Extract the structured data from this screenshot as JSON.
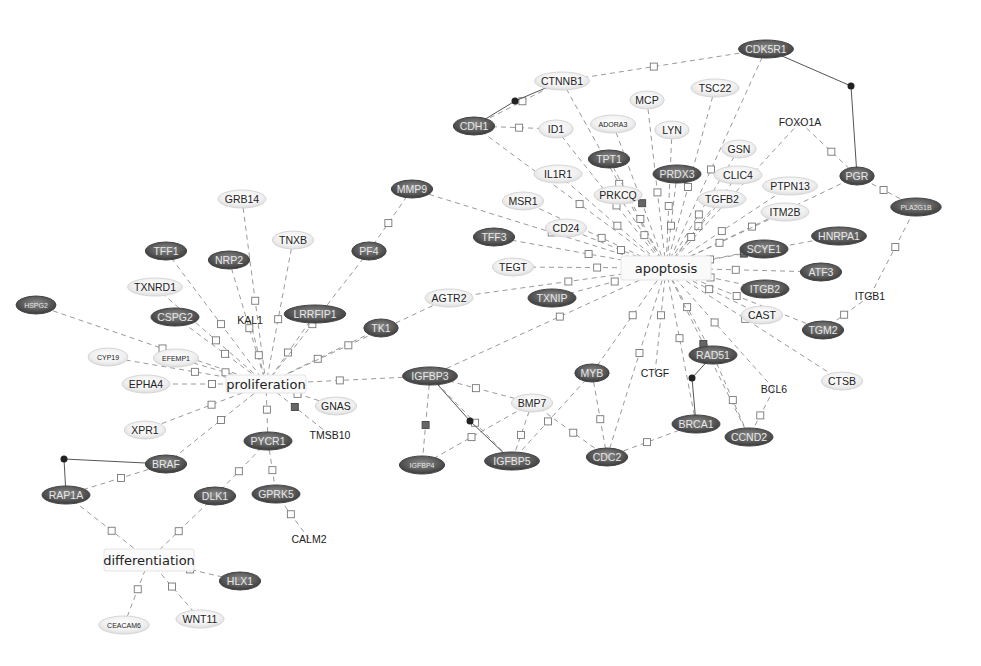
{
  "diagram": {
    "type": "gene-interaction-network",
    "processes": [
      {
        "id": "apoptosis",
        "label": "apoptosis",
        "x": 666,
        "y": 268,
        "w": 90,
        "h": 24
      },
      {
        "id": "proliferation",
        "label": "proliferation",
        "x": 266,
        "y": 384,
        "w": 80,
        "h": 18
      },
      {
        "id": "differentiation",
        "label": "differentiation",
        "x": 149,
        "y": 560,
        "w": 90,
        "h": 22
      }
    ],
    "nodes": [
      {
        "id": "CDK5R1",
        "label": "CDK5R1",
        "x": 766,
        "y": 49,
        "style": "dark"
      },
      {
        "id": "CTNNB1",
        "label": "CTNNB1",
        "x": 562,
        "y": 81,
        "style": "light"
      },
      {
        "id": "TSC22",
        "label": "TSC22",
        "x": 715,
        "y": 88,
        "style": "light"
      },
      {
        "id": "MCP",
        "label": "MCP",
        "x": 647,
        "y": 100,
        "style": "light"
      },
      {
        "id": "CDH1",
        "label": "CDH1",
        "x": 474,
        "y": 126,
        "style": "dark"
      },
      {
        "id": "ID1",
        "label": "ID1",
        "x": 556,
        "y": 129,
        "style": "light"
      },
      {
        "id": "ADORA3",
        "label": "ADORA3",
        "x": 613,
        "y": 124,
        "style": "light",
        "small": true
      },
      {
        "id": "LYN",
        "label": "LYN",
        "x": 672,
        "y": 130,
        "style": "light"
      },
      {
        "id": "FOXO1A",
        "label": "FOXO1A",
        "x": 800,
        "y": 122,
        "style": "plain"
      },
      {
        "id": "GSN",
        "label": "GSN",
        "x": 739,
        "y": 149,
        "style": "light"
      },
      {
        "id": "TPT1",
        "label": "TPT1",
        "x": 609,
        "y": 159,
        "style": "dark"
      },
      {
        "id": "PRDX3",
        "label": "PRDX3",
        "x": 677,
        "y": 174,
        "style": "dark"
      },
      {
        "id": "CLIC4",
        "label": "CLIC4",
        "x": 738,
        "y": 175,
        "style": "light"
      },
      {
        "id": "IL1R1",
        "label": "IL1R1",
        "x": 558,
        "y": 174,
        "style": "light"
      },
      {
        "id": "PRKCQ",
        "label": "PRKCQ",
        "x": 618,
        "y": 195,
        "style": "light"
      },
      {
        "id": "PGR",
        "label": "PGR",
        "x": 857,
        "y": 176,
        "style": "dark"
      },
      {
        "id": "PTPN13",
        "label": "PTPN13",
        "x": 790,
        "y": 186,
        "style": "light"
      },
      {
        "id": "MMP9",
        "label": "MMP9",
        "x": 412,
        "y": 189,
        "style": "dark"
      },
      {
        "id": "TGFB2",
        "label": "TGFB2",
        "x": 722,
        "y": 199,
        "style": "light"
      },
      {
        "id": "MSR1",
        "label": "MSR1",
        "x": 523,
        "y": 201,
        "style": "light"
      },
      {
        "id": "PLA2G1B",
        "label": "PLA2G1B",
        "x": 916,
        "y": 207,
        "style": "dark",
        "small": true
      },
      {
        "id": "ITM2B",
        "label": "ITM2B",
        "x": 785,
        "y": 212,
        "style": "light"
      },
      {
        "id": "CD24",
        "label": "CD24",
        "x": 566,
        "y": 228,
        "style": "light"
      },
      {
        "id": "TFF3",
        "label": "TFF3",
        "x": 494,
        "y": 237,
        "style": "dark"
      },
      {
        "id": "HNRPA1",
        "label": "HNRPA1",
        "x": 839,
        "y": 236,
        "style": "dark"
      },
      {
        "id": "PF4",
        "label": "PF4",
        "x": 369,
        "y": 251,
        "style": "dark"
      },
      {
        "id": "SCYE1",
        "label": "SCYE1",
        "x": 764,
        "y": 249,
        "style": "dark"
      },
      {
        "id": "TEGT",
        "label": "TEGT",
        "x": 513,
        "y": 267,
        "style": "light"
      },
      {
        "id": "ATF3",
        "label": "ATF3",
        "x": 821,
        "y": 272,
        "style": "dark"
      },
      {
        "id": "AGTR2",
        "label": "AGTR2",
        "x": 449,
        "y": 298,
        "style": "light"
      },
      {
        "id": "TXNIP",
        "label": "TXNIP",
        "x": 552,
        "y": 298,
        "style": "dark"
      },
      {
        "id": "ITOB2",
        "label": "ITGB2",
        "x": 765,
        "y": 289,
        "style": "dark"
      },
      {
        "id": "ITGB1",
        "label": "ITGB1",
        "x": 870,
        "y": 296,
        "style": "plain"
      },
      {
        "id": "CAST",
        "label": "CAST",
        "x": 762,
        "y": 315,
        "style": "light"
      },
      {
        "id": "TGM2",
        "label": "TGM2",
        "x": 823,
        "y": 330,
        "style": "dark"
      },
      {
        "id": "GRB14",
        "label": "GRB14",
        "x": 242,
        "y": 199,
        "style": "light"
      },
      {
        "id": "TNXB",
        "label": "TNXB",
        "x": 293,
        "y": 240,
        "style": "light"
      },
      {
        "id": "TFF1",
        "label": "TFF1",
        "x": 166,
        "y": 251,
        "style": "dark"
      },
      {
        "id": "NRP2",
        "label": "NRP2",
        "x": 229,
        "y": 260,
        "style": "dark"
      },
      {
        "id": "TXNRD1",
        "label": "TXNRD1",
        "x": 155,
        "y": 287,
        "style": "light"
      },
      {
        "id": "HSPG2",
        "label": "HSPG2",
        "x": 36,
        "y": 305,
        "style": "dark",
        "small": true
      },
      {
        "id": "CSPG2",
        "label": "CSPG2",
        "x": 175,
        "y": 317,
        "style": "dark"
      },
      {
        "id": "KAL1",
        "label": "KAL1",
        "x": 250,
        "y": 320,
        "style": "plain"
      },
      {
        "id": "LRRFIP1",
        "label": "LRRFIP1",
        "x": 315,
        "y": 314,
        "style": "dark"
      },
      {
        "id": "TK1",
        "label": "TK1",
        "x": 381,
        "y": 328,
        "style": "dark"
      },
      {
        "id": "CYP19",
        "label": "CYP19",
        "x": 108,
        "y": 357,
        "style": "light",
        "small": true
      },
      {
        "id": "EFEMP1",
        "label": "EFEMP1",
        "x": 176,
        "y": 358,
        "style": "light",
        "small": true
      },
      {
        "id": "EPHA4",
        "label": "EPHA4",
        "x": 146,
        "y": 384,
        "style": "light"
      },
      {
        "id": "GNAS",
        "label": "GNAS",
        "x": 336,
        "y": 406,
        "style": "light"
      },
      {
        "id": "TMSB10",
        "label": "TMSB10",
        "x": 330,
        "y": 435,
        "style": "plain"
      },
      {
        "id": "XPR1",
        "label": "XPR1",
        "x": 145,
        "y": 430,
        "style": "light"
      },
      {
        "id": "PYCR1",
        "label": "PYCR1",
        "x": 268,
        "y": 441,
        "style": "dark"
      },
      {
        "id": "BRAF",
        "label": "BRAF",
        "x": 166,
        "y": 464,
        "style": "dark"
      },
      {
        "id": "RAP1A",
        "label": "RAP1A",
        "x": 66,
        "y": 495,
        "style": "dark"
      },
      {
        "id": "DLK1",
        "label": "DLK1",
        "x": 215,
        "y": 496,
        "style": "dark"
      },
      {
        "id": "GPRK5",
        "label": "GPRK5",
        "x": 276,
        "y": 494,
        "style": "dark"
      },
      {
        "id": "CALM2",
        "label": "CALM2",
        "x": 309,
        "y": 539,
        "style": "plain"
      },
      {
        "id": "HLX1",
        "label": "HLX1",
        "x": 240,
        "y": 581,
        "style": "dark"
      },
      {
        "id": "CEACAM6",
        "label": "CEACAM6",
        "x": 124,
        "y": 625,
        "style": "light",
        "small": true
      },
      {
        "id": "WNT11",
        "label": "WNT11",
        "x": 200,
        "y": 619,
        "style": "light"
      },
      {
        "id": "IGFBP3",
        "label": "IGFBP3",
        "x": 430,
        "y": 376,
        "style": "dark"
      },
      {
        "id": "BMP7",
        "label": "BMP7",
        "x": 532,
        "y": 403,
        "style": "light"
      },
      {
        "id": "MYB",
        "label": "MYB",
        "x": 592,
        "y": 373,
        "style": "dark"
      },
      {
        "id": "CTGF",
        "label": "CTGF",
        "x": 655,
        "y": 373,
        "style": "plain"
      },
      {
        "id": "IGFBP4",
        "label": "IGFBP4",
        "x": 422,
        "y": 465,
        "style": "dark",
        "small": true
      },
      {
        "id": "IGFBP5",
        "label": "IGFBP5",
        "x": 512,
        "y": 461,
        "style": "dark"
      },
      {
        "id": "CDC2",
        "label": "CDC2",
        "x": 607,
        "y": 457,
        "style": "dark"
      },
      {
        "id": "RAD51",
        "label": "RAD51",
        "x": 713,
        "y": 355,
        "style": "dark"
      },
      {
        "id": "BCL6",
        "label": "BCL6",
        "x": 774,
        "y": 389,
        "style": "plain"
      },
      {
        "id": "CTSB",
        "label": "CTSB",
        "x": 842,
        "y": 381,
        "style": "light"
      },
      {
        "id": "BRCA1",
        "label": "BRCA1",
        "x": 696,
        "y": 424,
        "style": "dark"
      },
      {
        "id": "CCND2",
        "label": "CCND2",
        "x": 749,
        "y": 437,
        "style": "dark"
      }
    ],
    "edges": [
      [
        "CTNNB1",
        "apoptosis"
      ],
      [
        "TSC22",
        "apoptosis"
      ],
      [
        "MCP",
        "apoptosis"
      ],
      [
        "CDH1",
        "apoptosis"
      ],
      [
        "ID1",
        "apoptosis"
      ],
      [
        "ADORA3",
        "apoptosis"
      ],
      [
        "LYN",
        "apoptosis"
      ],
      [
        "FOXO1A",
        "apoptosis"
      ],
      [
        "GSN",
        "apoptosis"
      ],
      [
        "TPT1",
        "apoptosis"
      ],
      [
        "PRDX3",
        "apoptosis"
      ],
      [
        "CLIC4",
        "apoptosis"
      ],
      [
        "IL1R1",
        "apoptosis"
      ],
      [
        "PRKCQ",
        "apoptosis"
      ],
      [
        "PGR",
        "apoptosis"
      ],
      [
        "PTPN13",
        "apoptosis"
      ],
      [
        "MMP9",
        "apoptosis"
      ],
      [
        "TGFB2",
        "apoptosis"
      ],
      [
        "MSR1",
        "apoptosis"
      ],
      [
        "ITM2B",
        "apoptosis"
      ],
      [
        "CD24",
        "apoptosis"
      ],
      [
        "TFF3",
        "apoptosis"
      ],
      [
        "HNRPA1",
        "apoptosis"
      ],
      [
        "SCYE1",
        "apoptosis"
      ],
      [
        "TEGT",
        "apoptosis"
      ],
      [
        "ATF3",
        "apoptosis"
      ],
      [
        "AGTR2",
        "apoptosis"
      ],
      [
        "TXNIP",
        "apoptosis"
      ],
      [
        "ITOB2",
        "apoptosis"
      ],
      [
        "CAST",
        "apoptosis"
      ],
      [
        "TGM2",
        "apoptosis"
      ],
      [
        "CTSB",
        "apoptosis"
      ],
      [
        "IGFBP3",
        "apoptosis"
      ],
      [
        "MYB",
        "apoptosis"
      ],
      [
        "CTGF",
        "apoptosis"
      ],
      [
        "CDC2",
        "apoptosis"
      ],
      [
        "RAD51",
        "apoptosis"
      ],
      [
        "BCL6",
        "apoptosis"
      ],
      [
        "BRCA1",
        "apoptosis"
      ],
      [
        "CCND2",
        "apoptosis"
      ],
      [
        "CDK5R1",
        "apoptosis"
      ],
      [
        "CDK5R1",
        "CTNNB1"
      ],
      [
        "GRB14",
        "proliferation"
      ],
      [
        "TNXB",
        "proliferation"
      ],
      [
        "TFF1",
        "proliferation"
      ],
      [
        "NRP2",
        "proliferation"
      ],
      [
        "TXNRD1",
        "proliferation"
      ],
      [
        "HSPG2",
        "proliferation"
      ],
      [
        "CSPG2",
        "proliferation"
      ],
      [
        "KAL1",
        "proliferation"
      ],
      [
        "LRRFIP1",
        "proliferation"
      ],
      [
        "TK1",
        "proliferation"
      ],
      [
        "CYP19",
        "proliferation"
      ],
      [
        "EFEMP1",
        "proliferation"
      ],
      [
        "EPHA4",
        "proliferation"
      ],
      [
        "GNAS",
        "proliferation"
      ],
      [
        "TMSB10",
        "proliferation"
      ],
      [
        "XPR1",
        "proliferation"
      ],
      [
        "PYCR1",
        "proliferation"
      ],
      [
        "BRAF",
        "proliferation"
      ],
      [
        "PF4",
        "proliferation"
      ],
      [
        "IGFBP3",
        "proliferation"
      ],
      [
        "AGTR2",
        "proliferation"
      ],
      [
        "MMP9",
        "PF4"
      ],
      [
        "RAP1A",
        "differentiation"
      ],
      [
        "DLK1",
        "differentiation"
      ],
      [
        "HLX1",
        "differentiation"
      ],
      [
        "CEACAM6",
        "differentiation"
      ],
      [
        "WNT11",
        "differentiation"
      ],
      [
        "PYCR1",
        "DLK1"
      ],
      [
        "PYCR1",
        "GPRK5"
      ],
      [
        "CALM2",
        "GPRK5"
      ],
      [
        "RAP1A",
        "BRAF"
      ],
      [
        "IGFBP3",
        "IGFBP4"
      ],
      [
        "IGFBP3",
        "IGFBP5"
      ],
      [
        "BMP7",
        "IGFBP3"
      ],
      [
        "BMP7",
        "IGFBP5"
      ],
      [
        "BMP7",
        "IGFBP4"
      ],
      [
        "BMP7",
        "CDC2"
      ],
      [
        "MYB",
        "CDC2"
      ],
      [
        "MYB",
        "IGFBP5"
      ],
      [
        "BRCA1",
        "CDC2"
      ],
      [
        "BCL6",
        "CCND2"
      ],
      [
        "RAD51",
        "CCND2"
      ],
      [
        "ITGB1",
        "TGM2"
      ],
      [
        "ITGB1",
        "PLA2G1B"
      ],
      [
        "FOXO1A",
        "PGR"
      ],
      [
        "PLA2G1B",
        "PGR"
      ],
      [
        "CDH1",
        "ID1"
      ],
      [
        "CDH1",
        "CTNNB1"
      ]
    ],
    "bindings": [
      {
        "a": "CDH1",
        "b": "CTNNB1",
        "dot": [
          515,
          101
        ]
      },
      {
        "a": "CDK5R1",
        "b": "PGR",
        "dot": [
          851,
          86
        ],
        "corner": true
      },
      {
        "a": "RAP1A",
        "b": "BRAF",
        "dot": [
          64,
          459
        ],
        "corner": true
      },
      {
        "a": "IGFBP3",
        "b": "IGFBP5",
        "dot": [
          470,
          421
        ]
      },
      {
        "a": "RAD51",
        "b": "BRCA1",
        "dot": [
          692,
          378
        ]
      }
    ]
  }
}
